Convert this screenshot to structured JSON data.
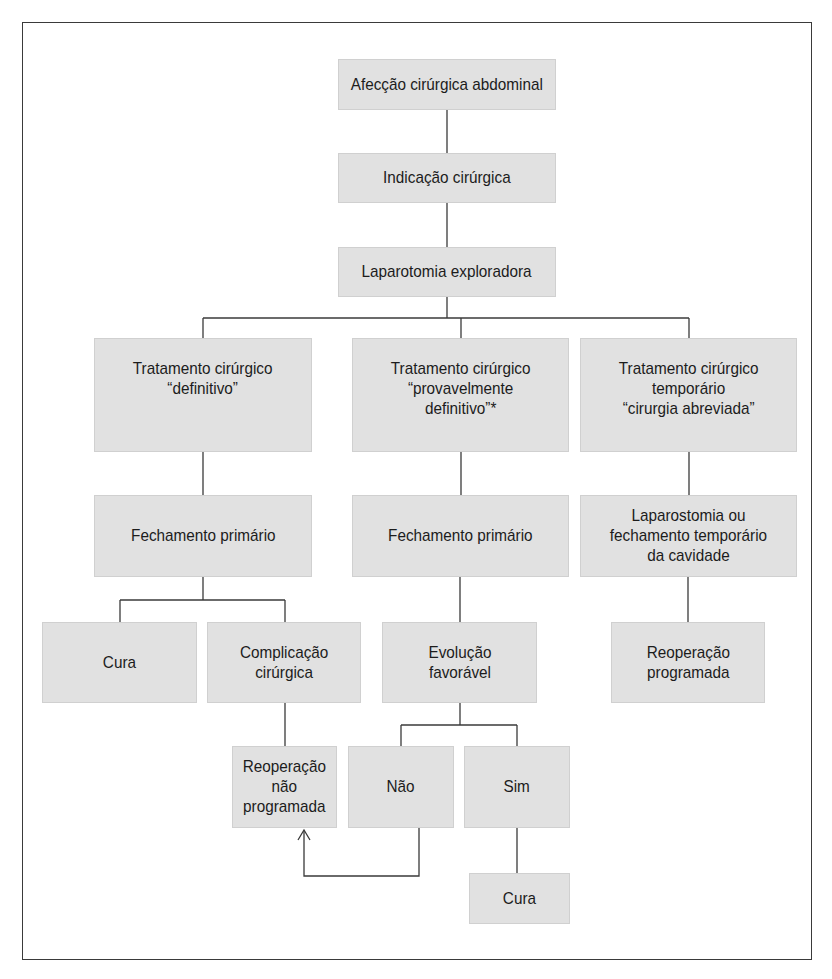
{
  "diagram": {
    "type": "flowchart",
    "nodes": {
      "afeccao": "Afecção cirúrgica abdominal",
      "indicacao": "Indicação cirúrgica",
      "laparotomia": "Laparotomia exploradora",
      "trat_definitivo": "Tratamento cirúrgico\n“definitivo”",
      "trat_provavel": "Tratamento cirúrgico\n“provavelmente\ndefinitivo”*",
      "trat_temporario": "Tratamento cirúrgico\ntemporário\n“cirurgia abreviada”",
      "fech_primario_1": "Fechamento primário",
      "fech_primario_2": "Fechamento primário",
      "laparostomia": "Laparostomia ou\nfechamento temporário\nda cavidade",
      "cura_1": "Cura",
      "complicacao": "Complicação\ncirúrgica",
      "evolucao": "Evolução\nfavorável",
      "reop_programada": "Reoperação\nprogramada",
      "reop_nao_programada": "Reoperação\nnão\nprogramada",
      "nao": "Não",
      "sim": "Sim",
      "cura_2": "Cura"
    },
    "edges": [
      [
        "afeccao",
        "indicacao"
      ],
      [
        "indicacao",
        "laparotomia"
      ],
      [
        "laparotomia",
        "trat_definitivo"
      ],
      [
        "laparotomia",
        "trat_provavel"
      ],
      [
        "laparotomia",
        "trat_temporario"
      ],
      [
        "trat_definitivo",
        "fech_primario_1"
      ],
      [
        "trat_provavel",
        "fech_primario_2"
      ],
      [
        "trat_temporario",
        "laparostomia"
      ],
      [
        "fech_primario_1",
        "cura_1"
      ],
      [
        "fech_primario_1",
        "complicacao"
      ],
      [
        "fech_primario_2",
        "evolucao"
      ],
      [
        "laparostomia",
        "reop_programada"
      ],
      [
        "complicacao",
        "reop_nao_programada"
      ],
      [
        "evolucao",
        "nao"
      ],
      [
        "evolucao",
        "sim"
      ],
      [
        "sim",
        "cura_2"
      ],
      [
        "nao",
        "reop_nao_programada"
      ]
    ],
    "colors": {
      "box_fill": "#e1e1e1",
      "line": "#3a3a3a",
      "text": "#1c1c1c"
    }
  }
}
